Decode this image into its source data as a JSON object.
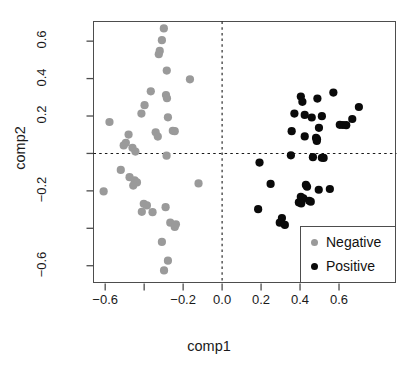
{
  "chart_data": {
    "type": "scatter",
    "title": "",
    "xlabel": "comp1",
    "ylabel": "comp2",
    "xlim": [
      -0.66,
      0.895
    ],
    "ylim": [
      -0.695,
      0.705
    ],
    "grid": false,
    "legend_position": "bottom-right",
    "xticks": [
      -0.6,
      -0.4,
      -0.2,
      0.0,
      0.2,
      0.4,
      0.6
    ],
    "xticklabels": [
      "-0.6",
      "",
      "-0.2",
      "0.0",
      "0.2",
      "0.4",
      "0.6"
    ],
    "yticks": [
      -0.6,
      -0.4,
      -0.2,
      0.0,
      0.2,
      0.4,
      0.6
    ],
    "yticklabels": [
      "-0.6",
      "",
      "-0.2",
      "",
      "0.2",
      "0.4",
      "0.6"
    ],
    "reference_lines": [
      {
        "orientation": "horizontal",
        "value": 0.0,
        "style": "dashed"
      },
      {
        "orientation": "vertical",
        "value": 0.0,
        "style": "dashed"
      }
    ],
    "series": [
      {
        "name": "Negative",
        "color": "#9a9a9a",
        "marker": "circle",
        "points": [
          [
            -0.299,
            0.668
          ],
          [
            -0.309,
            0.605
          ],
          [
            -0.32,
            0.548
          ],
          [
            -0.325,
            0.53
          ],
          [
            -0.284,
            0.443
          ],
          [
            -0.165,
            0.396
          ],
          [
            -0.366,
            0.332
          ],
          [
            -0.288,
            0.312
          ],
          [
            -0.283,
            0.295
          ],
          [
            -0.398,
            0.258
          ],
          [
            -0.414,
            0.213
          ],
          [
            -0.278,
            0.193
          ],
          [
            -0.578,
            0.168
          ],
          [
            -0.253,
            0.121
          ],
          [
            -0.243,
            0.119
          ],
          [
            -0.341,
            0.113
          ],
          [
            -0.48,
            0.101
          ],
          [
            -0.33,
            0.09
          ],
          [
            -0.494,
            0.057
          ],
          [
            -0.505,
            0.043
          ],
          [
            -0.46,
            0.03
          ],
          [
            -0.445,
            0.01
          ],
          [
            -0.285,
            -0.012
          ],
          [
            -0.52,
            -0.088
          ],
          [
            -0.475,
            -0.127
          ],
          [
            -0.449,
            -0.144
          ],
          [
            -0.437,
            -0.155
          ],
          [
            -0.121,
            -0.16
          ],
          [
            -0.456,
            -0.172
          ],
          [
            -0.608,
            -0.203
          ],
          [
            -0.402,
            -0.269
          ],
          [
            -0.386,
            -0.278
          ],
          [
            -0.29,
            -0.287
          ],
          [
            -0.412,
            -0.312
          ],
          [
            -0.357,
            -0.314
          ],
          [
            -0.266,
            -0.37
          ],
          [
            -0.237,
            -0.379
          ],
          [
            -0.243,
            -0.393
          ],
          [
            -0.309,
            -0.473
          ],
          [
            -0.278,
            -0.573
          ],
          [
            -0.298,
            -0.625
          ]
        ]
      },
      {
        "name": "Positive",
        "color": "#0a0a0a",
        "marker": "circle",
        "points": [
          [
            0.571,
            0.325
          ],
          [
            0.404,
            0.304
          ],
          [
            0.489,
            0.293
          ],
          [
            0.412,
            0.276
          ],
          [
            0.702,
            0.248
          ],
          [
            0.371,
            0.213
          ],
          [
            0.424,
            0.206
          ],
          [
            0.512,
            0.199
          ],
          [
            0.46,
            0.192
          ],
          [
            0.668,
            0.184
          ],
          [
            0.604,
            0.153
          ],
          [
            0.62,
            0.152
          ],
          [
            0.637,
            0.151
          ],
          [
            0.357,
            0.119
          ],
          [
            0.497,
            0.137
          ],
          [
            0.424,
            0.091
          ],
          [
            0.482,
            0.083
          ],
          [
            0.487,
            0.076
          ],
          [
            0.486,
            0.067
          ],
          [
            0.353,
            -0.01
          ],
          [
            0.466,
            -0.02
          ],
          [
            0.512,
            -0.023
          ],
          [
            0.521,
            -0.024
          ],
          [
            0.192,
            -0.049
          ],
          [
            0.249,
            -0.163
          ],
          [
            0.43,
            -0.168
          ],
          [
            0.436,
            -0.178
          ],
          [
            0.496,
            -0.194
          ],
          [
            0.553,
            -0.19
          ],
          [
            0.404,
            -0.232
          ],
          [
            0.417,
            -0.24
          ],
          [
            0.447,
            -0.253
          ],
          [
            0.455,
            -0.258
          ],
          [
            0.394,
            -0.262
          ],
          [
            0.406,
            -0.267
          ],
          [
            0.185,
            -0.298
          ],
          [
            0.307,
            -0.345
          ],
          [
            0.296,
            -0.37
          ],
          [
            0.322,
            -0.382
          ]
        ]
      }
    ]
  },
  "legend": {
    "items": [
      {
        "label": "Negative",
        "color": "#9a9a9a"
      },
      {
        "label": "Positive",
        "color": "#0a0a0a"
      }
    ]
  }
}
